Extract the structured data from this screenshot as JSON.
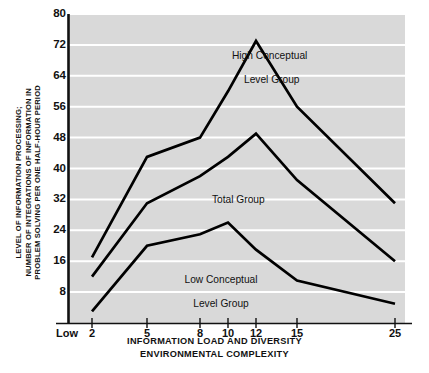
{
  "chart_data": {
    "type": "line",
    "title": "",
    "xlabel": "INFORMATION LOAD AND DIVERSITY\nENVIRONMENTAL COMPLEXITY",
    "xlabel_line1": "INFORMATION LOAD AND DIVERSITY",
    "xlabel_line2": "ENVIRONMENTAL COMPLEXITY",
    "ylabel": "LEVEL OF INFORMATION PROCESSING;\nNUMBER OF INTEGRATIONS OF INFORMATION IN\nPROBLEM SOLVING PER ONE HALF-HOUR PERIOD",
    "ylabel_line1": "LEVEL OF INFORMATION PROCESSING;",
    "ylabel_line2": "NUMBER OF INTEGRATIONS OF INFORMATION IN",
    "ylabel_line3": "PROBLEM SOLVING PER ONE HALF-HOUR PERIOD",
    "x_origin_label": "Low",
    "x": [
      2,
      5,
      8,
      10,
      12,
      15,
      25
    ],
    "xticklabels": [
      "2",
      "5",
      "8",
      "10",
      "12",
      "15",
      "25"
    ],
    "yticks": [
      8,
      16,
      24,
      32,
      40,
      48,
      56,
      64,
      72,
      80
    ],
    "ylim": [
      0,
      80
    ],
    "xlim_positions": [
      2,
      5,
      8,
      10,
      12,
      15,
      25
    ],
    "grid": true,
    "grid_color": "#ffffff",
    "plot_bg": "#d9d9d9",
    "line_color": "#000000",
    "legend": "inline-annotations",
    "series": [
      {
        "name": "High Conceptual Level Group",
        "label_line1": "High Conceptual",
        "label_line2": "Level Group",
        "values": [
          17,
          43,
          48,
          60,
          73,
          56,
          31
        ]
      },
      {
        "name": "Total Group",
        "label_line1": "Total Group",
        "label_line2": "",
        "values": [
          12,
          31,
          38,
          43,
          49,
          37,
          16
        ]
      },
      {
        "name": "Low Conceptual Level Group",
        "label_line1": "Low Conceptual",
        "label_line2": "Level Group",
        "values": [
          3,
          20,
          23,
          26,
          19,
          11,
          5
        ]
      }
    ]
  },
  "annotations": {
    "high_group": {
      "line1": "High Conceptual",
      "line2": "Level Group"
    },
    "total_group": {
      "line1": "Total Group"
    },
    "low_group": {
      "line1": "Low Conceptual",
      "line2": "Level Group"
    }
  }
}
